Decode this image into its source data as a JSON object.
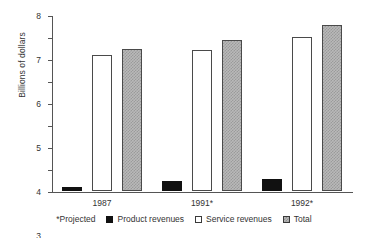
{
  "chart_data": {
    "type": "bar",
    "title": "",
    "xlabel": "",
    "ylabel": "Billions of dollars",
    "ylim": [
      0,
      8
    ],
    "yticks": [
      0,
      1,
      2,
      3,
      4,
      5,
      6,
      7,
      8
    ],
    "ytick_labels": [
      "0",
      "1",
      "2",
      "3",
      "4",
      "5",
      "6",
      "7",
      "8"
    ],
    "grid": false,
    "legend_position": "bottom",
    "categories": [
      "1987",
      "1991*",
      "1992*"
    ],
    "series": [
      {
        "name": "Product revenues",
        "color": "#111111",
        "values": [
          0.2,
          0.45,
          0.55
        ]
      },
      {
        "name": "Service revenues",
        "color": "#ffffff",
        "values": [
          6.2,
          6.4,
          7.0
        ]
      },
      {
        "name": "Total",
        "color": "#b9b9b9",
        "values": [
          6.45,
          6.85,
          7.55
        ]
      }
    ],
    "annotations": [
      "*Projected"
    ]
  },
  "legend": {
    "note": "*Projected",
    "items": [
      {
        "label": "Product revenues",
        "swatch": "black-square-icon"
      },
      {
        "label": "Service revenues",
        "swatch": "white-square-icon"
      },
      {
        "label": "Total",
        "swatch": "gray-hatched-square-icon"
      }
    ]
  }
}
